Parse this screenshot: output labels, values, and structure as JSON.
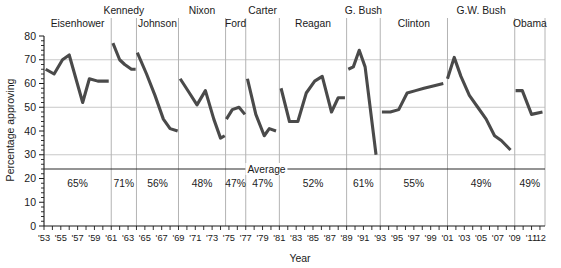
{
  "chart_data": {
    "type": "line",
    "title": "",
    "xlabel": "Year",
    "ylabel": "Percentage approving",
    "ylim": [
      0,
      80
    ],
    "ytick_values": [
      0,
      10,
      20,
      30,
      40,
      50,
      60,
      70,
      80
    ],
    "ytick_labels": [
      "0",
      "10",
      "20",
      "30",
      "40",
      "50",
      "60",
      "70",
      "80"
    ],
    "xlim": [
      1953,
      2012.6
    ],
    "xtick_labels": [
      "'53",
      "'55",
      "'57",
      "'59",
      "'61",
      "'63",
      "'65",
      "'67",
      "'69",
      "'71",
      "'73",
      "'75",
      "'77",
      "'79",
      "'81",
      "'83",
      "'85",
      "'87",
      "'89",
      "'91",
      "'93",
      "'95",
      "'97",
      "'99",
      "'01",
      "'03",
      "'05",
      "'07",
      "'09",
      "'11",
      "'12"
    ],
    "xtick_years": [
      1953,
      1955,
      1957,
      1959,
      1961,
      1963,
      1965,
      1967,
      1969,
      1971,
      1973,
      1975,
      1977,
      1979,
      1981,
      1983,
      1985,
      1987,
      1989,
      1991,
      1993,
      1995,
      1997,
      1999,
      2001,
      2003,
      2005,
      2007,
      2009,
      2011,
      2012
    ],
    "grid": "horizontal-and-vertical",
    "legend_position": "none",
    "annotation_average_label": "Average",
    "average_line_value": 24,
    "series": [
      {
        "name": "Eisenhower",
        "average_label": "65%",
        "points": [
          {
            "x": 1953.2,
            "y": 66
          },
          {
            "x": 1954.2,
            "y": 64
          },
          {
            "x": 1955.2,
            "y": 70
          },
          {
            "x": 1956.0,
            "y": 72
          },
          {
            "x": 1957.6,
            "y": 52
          },
          {
            "x": 1958.4,
            "y": 62
          },
          {
            "x": 1959.4,
            "y": 61
          },
          {
            "x": 1960.7,
            "y": 61
          }
        ]
      },
      {
        "name": "Kennedy",
        "average_label": "71%",
        "points": [
          {
            "x": 1961.2,
            "y": 77
          },
          {
            "x": 1962.0,
            "y": 70
          },
          {
            "x": 1962.6,
            "y": 68
          },
          {
            "x": 1963.4,
            "y": 66
          },
          {
            "x": 1963.9,
            "y": 66
          }
        ]
      },
      {
        "name": "Johnson",
        "average_label": "56%",
        "points": [
          {
            "x": 1964.1,
            "y": 73
          },
          {
            "x": 1965.2,
            "y": 64
          },
          {
            "x": 1966.2,
            "y": 55
          },
          {
            "x": 1967.2,
            "y": 45
          },
          {
            "x": 1968.0,
            "y": 41
          },
          {
            "x": 1968.9,
            "y": 40
          }
        ]
      },
      {
        "name": "Nixon",
        "average_label": "48%",
        "points": [
          {
            "x": 1969.2,
            "y": 62
          },
          {
            "x": 1970.3,
            "y": 56
          },
          {
            "x": 1971.2,
            "y": 51
          },
          {
            "x": 1972.2,
            "y": 57
          },
          {
            "x": 1973.2,
            "y": 45
          },
          {
            "x": 1974.0,
            "y": 37
          },
          {
            "x": 1974.5,
            "y": 38
          }
        ]
      },
      {
        "name": "Ford",
        "average_label": "47%",
        "points": [
          {
            "x": 1974.7,
            "y": 45
          },
          {
            "x": 1975.4,
            "y": 49
          },
          {
            "x": 1976.2,
            "y": 50
          },
          {
            "x": 1976.9,
            "y": 47
          }
        ]
      },
      {
        "name": "Carter",
        "average_label": "47%",
        "points": [
          {
            "x": 1977.2,
            "y": 62
          },
          {
            "x": 1978.2,
            "y": 47
          },
          {
            "x": 1979.2,
            "y": 38
          },
          {
            "x": 1979.8,
            "y": 41
          },
          {
            "x": 1980.6,
            "y": 40
          }
        ]
      },
      {
        "name": "Reagan",
        "average_label": "52%",
        "points": [
          {
            "x": 1981.2,
            "y": 58
          },
          {
            "x": 1982.2,
            "y": 44
          },
          {
            "x": 1983.2,
            "y": 44
          },
          {
            "x": 1984.2,
            "y": 56
          },
          {
            "x": 1985.2,
            "y": 61
          },
          {
            "x": 1986.1,
            "y": 63
          },
          {
            "x": 1987.2,
            "y": 48
          },
          {
            "x": 1988.0,
            "y": 54
          },
          {
            "x": 1988.8,
            "y": 54
          }
        ]
      },
      {
        "name": "G. Bush",
        "average_label": "61%",
        "points": [
          {
            "x": 1989.2,
            "y": 66
          },
          {
            "x": 1989.8,
            "y": 67
          },
          {
            "x": 1990.5,
            "y": 74
          },
          {
            "x": 1991.2,
            "y": 67
          },
          {
            "x": 1992.5,
            "y": 30
          }
        ]
      },
      {
        "name": "Clinton",
        "average_label": "55%",
        "points": [
          {
            "x": 1993.2,
            "y": 48
          },
          {
            "x": 1994.2,
            "y": 48
          },
          {
            "x": 1995.2,
            "y": 49
          },
          {
            "x": 1996.2,
            "y": 56
          },
          {
            "x": 1997.2,
            "y": 57
          },
          {
            "x": 1998.2,
            "y": 58
          },
          {
            "x": 1999.3,
            "y": 59
          },
          {
            "x": 2000.5,
            "y": 60
          }
        ]
      },
      {
        "name": "G.W. Bush",
        "average_label": "49%",
        "points": [
          {
            "x": 2001.0,
            "y": 62
          },
          {
            "x": 2001.8,
            "y": 71
          },
          {
            "x": 2002.6,
            "y": 63
          },
          {
            "x": 2003.6,
            "y": 55
          },
          {
            "x": 2004.6,
            "y": 50
          },
          {
            "x": 2005.6,
            "y": 45
          },
          {
            "x": 2006.6,
            "y": 38
          },
          {
            "x": 2007.4,
            "y": 36
          },
          {
            "x": 2008.5,
            "y": 32
          }
        ]
      },
      {
        "name": "Obama",
        "average_label": "49%",
        "points": [
          {
            "x": 2009.1,
            "y": 57
          },
          {
            "x": 2009.9,
            "y": 57
          },
          {
            "x": 2011.0,
            "y": 47
          },
          {
            "x": 2012.3,
            "y": 48
          }
        ]
      }
    ],
    "president_terms": [
      {
        "name": "Eisenhower",
        "start": 1953.0,
        "end": 1961.0,
        "row": 1,
        "pct": "65%"
      },
      {
        "name": "Kennedy",
        "start": 1961.0,
        "end": 1964.0,
        "row": 0,
        "pct": "71%"
      },
      {
        "name": "Johnson",
        "start": 1964.0,
        "end": 1969.0,
        "row": 1,
        "pct": "56%"
      },
      {
        "name": "Nixon",
        "start": 1969.0,
        "end": 1974.6,
        "row": 0,
        "pct": "48%"
      },
      {
        "name": "Ford",
        "start": 1974.6,
        "end": 1977.0,
        "row": 1,
        "pct": "47%"
      },
      {
        "name": "Carter",
        "start": 1977.0,
        "end": 1981.0,
        "row": 0,
        "pct": "47%"
      },
      {
        "name": "Reagan",
        "start": 1981.0,
        "end": 1989.0,
        "row": 1,
        "pct": "52%"
      },
      {
        "name": "G. Bush",
        "start": 1989.0,
        "end": 1993.0,
        "row": 0,
        "pct": "61%"
      },
      {
        "name": "Clinton",
        "start": 1993.0,
        "end": 2001.0,
        "row": 1,
        "pct": "55%"
      },
      {
        "name": "G.W. Bush",
        "start": 2001.0,
        "end": 2009.0,
        "row": 0,
        "pct": "49%"
      },
      {
        "name": "Obama",
        "start": 2009.0,
        "end": 2012.6,
        "row": 1,
        "pct": "49%"
      }
    ]
  }
}
